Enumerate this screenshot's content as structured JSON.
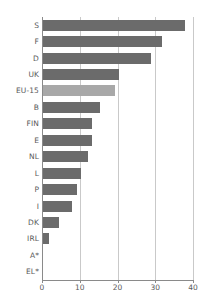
{
  "chart_data": {
    "type": "bar",
    "orientation": "horizontal",
    "title": "",
    "subtitle": "",
    "xlabel": "",
    "ylabel": "",
    "xlim": [
      0,
      40
    ],
    "xticks": [
      0,
      10,
      20,
      30,
      40
    ],
    "xtick_labels": [
      "0",
      "10",
      "20",
      "30",
      "40"
    ],
    "grid": true,
    "grid_axis": "x",
    "legend": null,
    "categories": [
      "S",
      "F",
      "D",
      "UK",
      "EU-15",
      "B",
      "FIN",
      "E",
      "NL",
      "L",
      "P",
      "I",
      "DK",
      "IRL",
      "A*",
      "EL*"
    ],
    "values": [
      37.5,
      31.5,
      28.5,
      20.0,
      19.0,
      15.0,
      13.0,
      13.0,
      12.0,
      10.0,
      9.0,
      7.7,
      4.2,
      1.5,
      0,
      0
    ],
    "highlight_category": "EU-15",
    "colors": {
      "bar": "#6b6b6b",
      "bar_highlight": "#a8a8a8",
      "grid": "#c9c9c9",
      "axis": "#8a8a8a",
      "text": "#5a5a5a",
      "background": "#ffffff"
    }
  }
}
